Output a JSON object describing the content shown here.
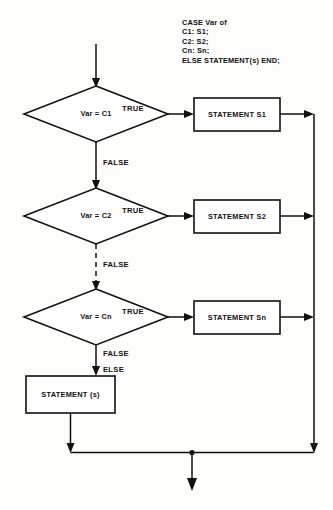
{
  "diagram": {
    "background_color": "#fdfdfc",
    "line_color": "#111111"
  },
  "pseudo_code": {
    "lines": [
      "CASE Var of",
      "C1: S1;",
      "C2: S2;",
      "Cn: Sn;",
      "ELSE STATEMENT(s) END;"
    ]
  },
  "decisions": [
    {
      "label": "Var = C1",
      "true_label": "TRUE",
      "false_label": "FALSE"
    },
    {
      "label": "Var = C2",
      "true_label": "TRUE",
      "false_label": "FALSE"
    },
    {
      "label": "Var = Cn",
      "true_label": "TRUE",
      "false_label": "FALSE"
    }
  ],
  "statements": [
    {
      "label": "STATEMENT S1"
    },
    {
      "label": "STATEMENT S2"
    },
    {
      "label": "STATEMENT Sn"
    }
  ],
  "else_branch": {
    "edge_label": "ELSE",
    "statement_label": "STATEMENT (s)"
  }
}
